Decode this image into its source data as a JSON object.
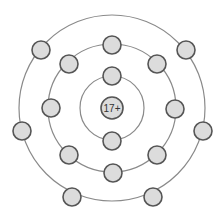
{
  "diagram": {
    "type": "bohr-model",
    "nucleus": {
      "label": "17+",
      "cx": 112,
      "cy": 108,
      "r": 11
    },
    "shells": [
      {
        "r": 32,
        "electrons": [
          [
            112,
            76
          ],
          [
            112,
            141
          ]
        ]
      },
      {
        "r": 64,
        "electrons": [
          [
            112,
            45
          ],
          [
            157,
            64
          ],
          [
            175,
            109
          ],
          [
            157,
            155
          ],
          [
            113,
            173
          ],
          [
            69,
            155
          ],
          [
            51,
            108
          ],
          [
            69,
            64
          ]
        ]
      },
      {
        "r": 93,
        "electrons": [
          [
            186,
            50
          ],
          [
            203,
            131
          ],
          [
            153,
            197
          ],
          [
            72,
            197
          ],
          [
            22,
            131
          ],
          [
            41,
            50
          ]
        ]
      }
    ],
    "extra_outer_electron_note": "outer shell shows 6 visible + (count total 7 incl. omitted?)",
    "electron_radius": 9,
    "colors": {
      "fill": "#dcdcdc",
      "stroke": "#555555",
      "shell": "#8a8a8a"
    }
  }
}
